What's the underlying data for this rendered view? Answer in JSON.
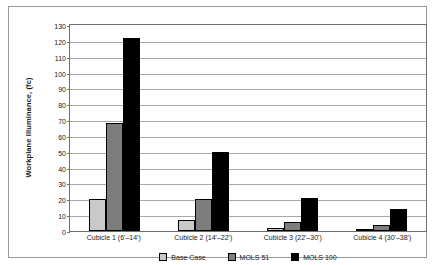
{
  "chart_data": {
    "type": "bar",
    "title": "",
    "xlabel": "",
    "ylabel": "Workplane Illuminance, (fc)",
    "categories": [
      "Cubicle 1 (6'–14')",
      "Cubicle 2 (14'–22')",
      "Cubicle 3 (22'–30')",
      "Cubicle 4 (30'–38')"
    ],
    "series": [
      {
        "name": "Base Case",
        "color": "#c9c9c9",
        "values": [
          20,
          7,
          2,
          1
        ]
      },
      {
        "name": "MOLS 51",
        "color": "#7d7d7d",
        "values": [
          68,
          20,
          6,
          4
        ]
      },
      {
        "name": "MOLS 100",
        "color": "#000000",
        "values": [
          122,
          50,
          21,
          14
        ]
      }
    ],
    "ylim": [
      0,
      130
    ],
    "ytick_step": 10,
    "yticks": [
      0,
      10,
      20,
      30,
      40,
      50,
      60,
      70,
      80,
      90,
      100,
      110,
      120,
      130
    ],
    "grid": "horizontal",
    "legend_position": "bottom"
  }
}
